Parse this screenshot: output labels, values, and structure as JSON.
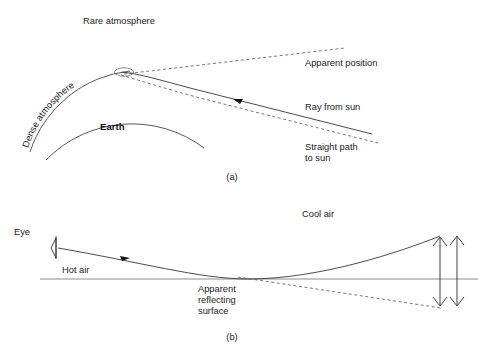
{
  "figure": {
    "title_a_caption": "(a)",
    "title_b_caption": "(b)",
    "background_color": "#ffffff",
    "line_color": "#2b2b2b",
    "ground_color": "#8c8c8c"
  },
  "panel_a": {
    "labels": {
      "rare_atmosphere": "Rare atmosphere",
      "dense_atmosphere": "Dense atmosphere",
      "earth": "Earth",
      "apparent_position": "Apparent position",
      "ray_from_sun": "Ray from sun",
      "straight_path_to_sun_line1": "Straight path",
      "straight_path_to_sun_line2": "to sun"
    },
    "caption": "(a)"
  },
  "panel_b": {
    "labels": {
      "eye": "Eye",
      "cool_air": "Cool air",
      "hot_air": "Hot air",
      "apparent_reflecting_surface_line1": "Apparent",
      "apparent_reflecting_surface_line2": "reflecting",
      "apparent_reflecting_surface_line3": "surface"
    },
    "caption": "(b)"
  }
}
